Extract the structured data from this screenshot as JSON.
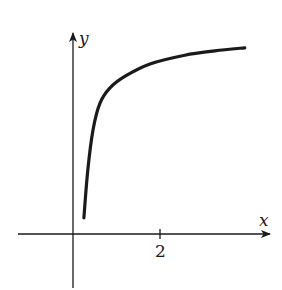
{
  "chart_data": {
    "type": "line",
    "title": "",
    "xlabel": "x",
    "ylabel": "y",
    "x_ticks": [
      {
        "value": 2,
        "label": "2"
      }
    ],
    "y_ticks": [],
    "grid": false,
    "legend": null,
    "xlim": [
      -1.25,
      4.5
    ],
    "ylim": [
      -1.25,
      4.5
    ],
    "series": [
      {
        "name": "curve",
        "color": "#1a1a1a",
        "description": "Increasing concave curve with vertical asymptote near x=0 (steep rise), leveling off to a horizontal asymptote",
        "points": [
          {
            "x": 0.25,
            "y": 0.37
          },
          {
            "x": 0.34,
            "y": 1.47
          },
          {
            "x": 0.46,
            "y": 2.39
          },
          {
            "x": 0.62,
            "y": 3.01
          },
          {
            "x": 0.85,
            "y": 3.36
          },
          {
            "x": 1.2,
            "y": 3.63
          },
          {
            "x": 1.77,
            "y": 3.91
          },
          {
            "x": 2.57,
            "y": 4.11
          },
          {
            "x": 3.26,
            "y": 4.21
          },
          {
            "x": 3.95,
            "y": 4.28
          }
        ]
      }
    ]
  },
  "labels": {
    "x_axis": "x",
    "y_axis": "y",
    "tick_2": "2"
  },
  "colors": {
    "ink": "#1a1a1a",
    "background": "#ffffff"
  }
}
